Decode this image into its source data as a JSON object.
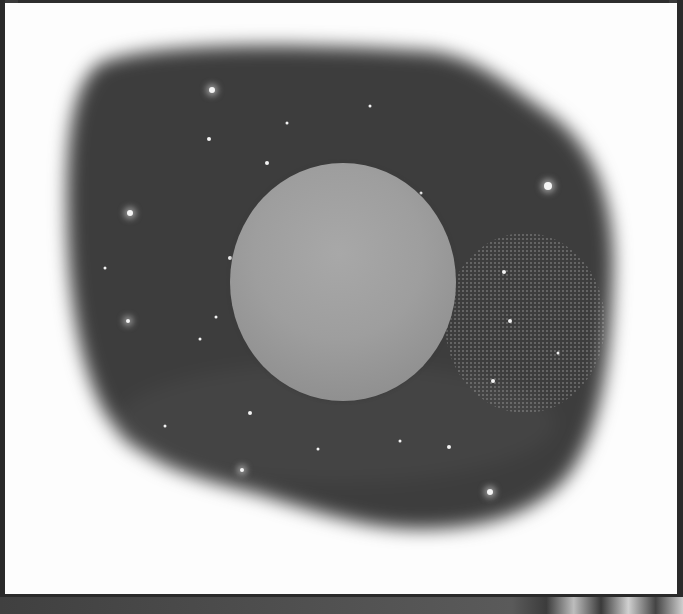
{
  "scene": {
    "description": "Grayscale print of a pale sphere (planet) centered inside an irregular dark starfield blob on a white panel",
    "colors": {
      "panel": "#fdfdfd",
      "frame": "#2a2a2a",
      "blob": "#3c3c3c",
      "sphere": "#9e9e9e",
      "star": "#f4f4f4"
    },
    "sphere": {
      "cx": 338,
      "cy": 279,
      "rx": 113,
      "ry": 119
    },
    "stars": [
      {
        "x": 207,
        "y": 87,
        "r": 3,
        "glow": true
      },
      {
        "x": 204,
        "y": 136,
        "r": 2,
        "glow": false
      },
      {
        "x": 262,
        "y": 160,
        "r": 2,
        "glow": false
      },
      {
        "x": 125,
        "y": 210,
        "r": 3,
        "glow": true
      },
      {
        "x": 543,
        "y": 183,
        "r": 4,
        "glow": true
      },
      {
        "x": 225,
        "y": 255,
        "r": 2,
        "glow": false
      },
      {
        "x": 211,
        "y": 314,
        "r": 1.5,
        "glow": false
      },
      {
        "x": 195,
        "y": 336,
        "r": 1.5,
        "glow": false
      },
      {
        "x": 245,
        "y": 410,
        "r": 2,
        "glow": false
      },
      {
        "x": 237,
        "y": 467,
        "r": 2,
        "glow": true
      },
      {
        "x": 160,
        "y": 423,
        "r": 1.5,
        "glow": false
      },
      {
        "x": 395,
        "y": 438,
        "r": 1.5,
        "glow": false
      },
      {
        "x": 444,
        "y": 444,
        "r": 2,
        "glow": false
      },
      {
        "x": 485,
        "y": 489,
        "r": 3,
        "glow": true
      },
      {
        "x": 313,
        "y": 446,
        "r": 1.5,
        "glow": false
      },
      {
        "x": 499,
        "y": 269,
        "r": 2,
        "glow": false
      },
      {
        "x": 505,
        "y": 318,
        "r": 2,
        "glow": false
      },
      {
        "x": 488,
        "y": 378,
        "r": 2,
        "glow": false
      },
      {
        "x": 553,
        "y": 350,
        "r": 1.5,
        "glow": false
      },
      {
        "x": 416,
        "y": 190,
        "r": 1.5,
        "glow": false
      },
      {
        "x": 365,
        "y": 103,
        "r": 1.5,
        "glow": false
      },
      {
        "x": 282,
        "y": 120,
        "r": 1.5,
        "glow": false
      },
      {
        "x": 100,
        "y": 265,
        "r": 1.5,
        "glow": false
      },
      {
        "x": 123,
        "y": 318,
        "r": 2,
        "glow": true
      }
    ]
  }
}
